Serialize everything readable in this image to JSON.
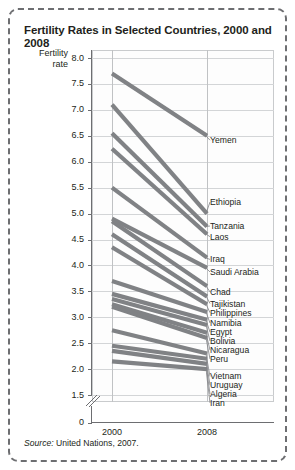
{
  "figure": {
    "title": "Fertility Rates in Selected Countries, 2000 and 2008",
    "axis_title_line1": "Fertility",
    "axis_title_line2": "rate",
    "source_word": "Source:",
    "source_text": " United Nations, 2007."
  },
  "chart_data": {
    "type": "line",
    "title": "Fertility Rates in Selected Countries, 2000 and 2008",
    "xlabel": "",
    "ylabel": "Fertility rate",
    "x": [
      "2000",
      "2008"
    ],
    "xtick_labels": [
      "2000",
      "2008"
    ],
    "ytick_labels": [
      "8.0",
      "7.5",
      "7.0",
      "6.5",
      "6.0",
      "5.5",
      "5.0",
      "4.5",
      "4.0",
      "3.5",
      "3.0",
      "2.5",
      "2.0",
      "1.5",
      "0"
    ],
    "ylim": [
      1.5,
      8.0
    ],
    "y_axis_break": true,
    "y_axis_break_note": "axis broken between 1.5 and 0",
    "grid": true,
    "legend_position": "right-labels",
    "line_color": "#808285",
    "series": [
      {
        "name": "Yemen",
        "values": [
          7.7,
          6.5
        ]
      },
      {
        "name": "Ethiopia",
        "values": [
          7.1,
          5.0
        ]
      },
      {
        "name": "Tanzania",
        "values": [
          6.55,
          4.75
        ]
      },
      {
        "name": "Laos",
        "values": [
          6.25,
          4.6
        ]
      },
      {
        "name": "Iraq",
        "values": [
          5.5,
          4.15
        ]
      },
      {
        "name": "Saudi Arabia",
        "values": [
          4.9,
          3.95
        ]
      },
      {
        "name": "Chad",
        "values": [
          4.85,
          3.6
        ]
      },
      {
        "name": "Tajikistan",
        "values": [
          4.6,
          3.4
        ]
      },
      {
        "name": "Philippines",
        "values": [
          4.35,
          3.25
        ]
      },
      {
        "name": "Namibia",
        "values": [
          3.7,
          3.1
        ]
      },
      {
        "name": "Egypt",
        "values": [
          3.45,
          2.95
        ]
      },
      {
        "name": "Bolivia",
        "values": [
          3.35,
          2.85
        ]
      },
      {
        "name": "Nicaragua",
        "values": [
          3.25,
          2.7
        ]
      },
      {
        "name": "Peru",
        "values": [
          3.2,
          2.6
        ]
      },
      {
        "name": "Vietnam",
        "values": [
          2.75,
          2.3
        ]
      },
      {
        "name": "Uruguay",
        "values": [
          2.45,
          2.2
        ]
      },
      {
        "name": "Algeria",
        "values": [
          2.35,
          2.1
        ]
      },
      {
        "name": "Iran",
        "values": [
          2.15,
          2.0
        ]
      }
    ]
  },
  "country_labels": [
    {
      "name": "Yemen",
      "top": 126
    },
    {
      "name": "Ethiopia",
      "top": 188
    },
    {
      "name": "Tanzania",
      "top": 212
    },
    {
      "name": "Laos",
      "top": 223
    },
    {
      "name": "Iraq",
      "top": 245
    },
    {
      "name": "Saudi Arabia",
      "top": 258
    },
    {
      "name": "Chad",
      "top": 278
    },
    {
      "name": "Tajikistan",
      "top": 290
    },
    {
      "name": "Philippines",
      "top": 299
    },
    {
      "name": "Namibia",
      "top": 309
    },
    {
      "name": "Egypt",
      "top": 318
    },
    {
      "name": "Bolivia",
      "top": 327
    },
    {
      "name": "Nicaragua",
      "top": 336
    },
    {
      "name": "Peru",
      "top": 345
    },
    {
      "name": "Vietnam",
      "top": 362
    },
    {
      "name": "Uruguay",
      "top": 371
    },
    {
      "name": "Algeria",
      "top": 380
    },
    {
      "name": "Iran",
      "top": 389
    }
  ]
}
